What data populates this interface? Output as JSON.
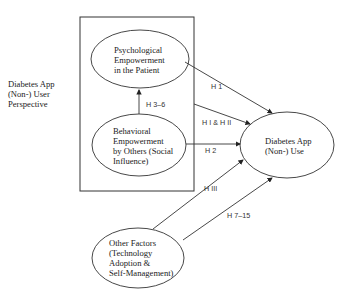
{
  "side_label": [
    "Diabetes App",
    "(Non-) User",
    "Perspective"
  ],
  "nodes": {
    "psychological": [
      "Psychological",
      "Empowerment",
      "in the Patient"
    ],
    "behavioral": [
      "Behavioral",
      "Empowerment",
      "by Others (Social",
      "Influence)"
    ],
    "other": [
      "Other Factors",
      "(Technology",
      "Adoption &",
      "Self-Management)"
    ],
    "use": [
      "Diabetes App",
      "(Non-) Use"
    ]
  },
  "edges": {
    "h3_6": "H 3–6",
    "h1": "H 1",
    "h1_h2": "H I & H II",
    "h2": "H 2",
    "h3": "H III",
    "h7_15": "H 7–15"
  },
  "colors": {
    "stroke": "#333333",
    "text": "#222222"
  }
}
